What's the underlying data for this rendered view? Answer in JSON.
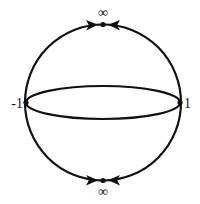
{
  "diagram": {
    "type": "compactified-sphere",
    "colors": {
      "stroke": "#111111",
      "background": "#ffffff"
    },
    "labels": {
      "top": "∞",
      "bottom": "∞",
      "left": "-1",
      "right": "1"
    },
    "points": [
      {
        "id": "top-infinity",
        "label": "∞",
        "x": 103,
        "y": 24
      },
      {
        "id": "bottom-infinity",
        "label": "∞",
        "x": 103,
        "y": 181
      },
      {
        "id": "left-point",
        "label": "-1",
        "x": 26,
        "y": 102
      },
      {
        "id": "right-point",
        "label": "1",
        "x": 180,
        "y": 102
      }
    ],
    "arrows": [
      {
        "on": "upper-left-arc",
        "direction": "toward top-infinity"
      },
      {
        "on": "upper-right-arc",
        "direction": "toward top-infinity"
      },
      {
        "on": "lower-left-arc",
        "direction": "toward bottom-infinity"
      },
      {
        "on": "lower-right-arc",
        "direction": "toward bottom-infinity"
      }
    ]
  }
}
